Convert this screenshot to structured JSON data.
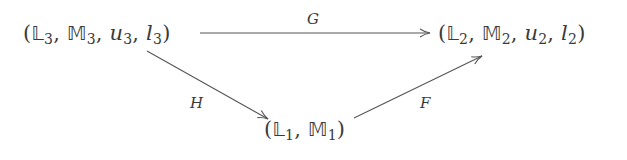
{
  "diagram": {
    "type": "commutative-diagram",
    "nodes": [
      {
        "id": "n3",
        "position": "top-left",
        "open": "(",
        "parts": [
          {
            "symbol": "𝕃",
            "sub": "3",
            "style": "double-struck"
          },
          {
            "symbol": "𝕄",
            "sub": "3",
            "style": "double-struck"
          },
          {
            "symbol": "u",
            "sub": "3",
            "style": "italic"
          },
          {
            "symbol": "l",
            "sub": "3",
            "style": "italic"
          }
        ],
        "separator": ", ",
        "close": ")",
        "text": "(𝕃₃, 𝕄₃, u₃, l₃)"
      },
      {
        "id": "n2",
        "position": "top-right",
        "open": "(",
        "parts": [
          {
            "symbol": "𝕃",
            "sub": "2",
            "style": "double-struck"
          },
          {
            "symbol": "𝕄",
            "sub": "2",
            "style": "double-struck"
          },
          {
            "symbol": "u",
            "sub": "2",
            "style": "italic"
          },
          {
            "symbol": "l",
            "sub": "2",
            "style": "italic"
          }
        ],
        "separator": ", ",
        "close": ")",
        "text": "(𝕃₂, 𝕄₂, u₂, l₂)"
      },
      {
        "id": "n1",
        "position": "bottom-center",
        "open": "(",
        "parts": [
          {
            "symbol": "𝕃",
            "sub": "1",
            "style": "double-struck"
          },
          {
            "symbol": "𝕄",
            "sub": "1",
            "style": "double-struck"
          }
        ],
        "separator": ", ",
        "close": ")",
        "text": "(𝕃₁, 𝕄₁)"
      }
    ],
    "edges": [
      {
        "id": "G",
        "from": "n3",
        "to": "n2",
        "label": "G"
      },
      {
        "id": "H",
        "from": "n3",
        "to": "n1",
        "label": "H"
      },
      {
        "id": "F",
        "from": "n1",
        "to": "n2",
        "label": "F"
      }
    ],
    "colors": {
      "background": "#ffffff",
      "ink": "#3a3a3a",
      "arrow": "#555555"
    }
  }
}
